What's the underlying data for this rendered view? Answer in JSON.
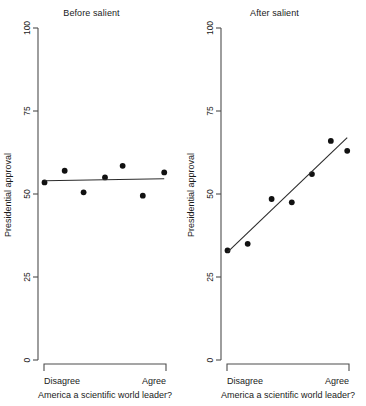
{
  "figure": {
    "width": 366,
    "height": 406,
    "background": "#ffffff",
    "point_color": "#111111",
    "line_color": "#2b2b2b",
    "axis_color": "#4d4d4d"
  },
  "chart_data": [
    {
      "type": "scatter",
      "title": "Before salient",
      "xlabel": "America a scientific world leader?",
      "ylabel": "Presidential approval",
      "ylim": [
        0,
        100
      ],
      "yticks": [
        0,
        25,
        50,
        75,
        100
      ],
      "yticklabels": [
        "0",
        "25",
        "50",
        "75",
        "100"
      ],
      "xlim": [
        0,
        1
      ],
      "xticklabels": [
        "Disagree",
        "Agree"
      ],
      "grid": false,
      "legend": "none",
      "x": [
        0.02,
        0.18,
        0.33,
        0.5,
        0.64,
        0.8,
        0.97
      ],
      "y": [
        53.5,
        57.0,
        50.5,
        55.0,
        58.5,
        49.5,
        56.5
      ],
      "fit_line": {
        "x0": 0.02,
        "y0": 54.0,
        "x1": 0.97,
        "y1": 54.6
      }
    },
    {
      "type": "scatter",
      "title": "After salient",
      "xlabel": "America a scientific world leader?",
      "ylabel": "Presidential approval",
      "ylim": [
        0,
        100
      ],
      "yticks": [
        0,
        25,
        50,
        75,
        100
      ],
      "yticklabels": [
        "0",
        "25",
        "50",
        "75",
        "100"
      ],
      "xlim": [
        0,
        1
      ],
      "xticklabels": [
        "Disagree",
        "Agree"
      ],
      "grid": false,
      "legend": "none",
      "x": [
        0.02,
        0.18,
        0.37,
        0.53,
        0.69,
        0.84,
        0.97
      ],
      "y": [
        33.0,
        35.0,
        48.5,
        47.5,
        56.0,
        66.0,
        63.0
      ],
      "fit_line": {
        "x0": 0.02,
        "y0": 32.5,
        "x1": 0.97,
        "y1": 67.0
      }
    }
  ]
}
